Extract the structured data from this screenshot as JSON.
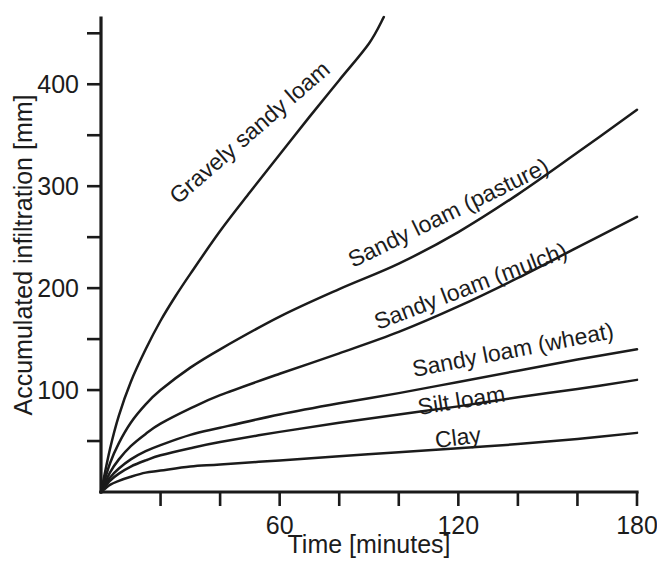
{
  "chart_data": {
    "type": "line",
    "title": "",
    "xlabel": "Time [minutes]",
    "ylabel": "Accumulated infiltration [mm]",
    "xlim": [
      0,
      180
    ],
    "ylim": [
      0,
      465
    ],
    "grid": false,
    "legend_position": "inline-curve-labels",
    "x_ticks_major": [
      60,
      120,
      180
    ],
    "x_ticks_major_labels": [
      "60",
      "120",
      "180"
    ],
    "x_ticks_minor": [
      20,
      40,
      80,
      100,
      140,
      160
    ],
    "y_ticks_major": [
      100,
      200,
      300,
      400
    ],
    "y_ticks_major_labels": [
      "100",
      "200",
      "300",
      "400"
    ],
    "y_ticks_minor": [
      50,
      150,
      250,
      350,
      450
    ],
    "x": [
      0,
      5,
      10,
      15,
      20,
      30,
      40,
      50,
      60,
      80,
      100,
      120,
      140,
      160,
      180
    ],
    "series": [
      {
        "name": "Gravely sandy loam",
        "label": "Gravely sandy loam",
        "x": [
          0,
          3,
          6,
          10,
          15,
          20,
          25,
          30,
          40,
          50,
          60,
          70,
          80,
          90,
          95
        ],
        "values": [
          0,
          42,
          75,
          108,
          140,
          168,
          192,
          214,
          256,
          294,
          331,
          368,
          404,
          440,
          466
        ]
      },
      {
        "name": "Sandy loam (pasture)",
        "label": "Sandy loam (pasture)",
        "x": [
          0,
          3,
          6,
          10,
          15,
          20,
          30,
          40,
          60,
          80,
          100,
          120,
          140,
          160,
          180
        ],
        "values": [
          0,
          28,
          48,
          68,
          86,
          100,
          122,
          140,
          172,
          199,
          224,
          255,
          292,
          333,
          375
        ]
      },
      {
        "name": "Sandy loam (mulch)",
        "label": "Sandy loam (mulch)",
        "x": [
          0,
          3,
          6,
          10,
          15,
          20,
          30,
          40,
          60,
          80,
          100,
          120,
          140,
          160,
          180
        ],
        "values": [
          0,
          19,
          32,
          45,
          57,
          67,
          82,
          95,
          116,
          136,
          157,
          182,
          210,
          240,
          270
        ]
      },
      {
        "name": "Sandy loam (wheat)",
        "label": "Sandy loam (wheat)",
        "x": [
          0,
          3,
          6,
          10,
          15,
          20,
          30,
          40,
          60,
          80,
          100,
          120,
          140,
          160,
          180
        ],
        "values": [
          0,
          14,
          23,
          32,
          40,
          46,
          56,
          63,
          76,
          87,
          97,
          108,
          119,
          130,
          140
        ]
      },
      {
        "name": "Silt loam",
        "label": "Silt loam",
        "x": [
          0,
          3,
          6,
          10,
          15,
          20,
          30,
          40,
          60,
          80,
          100,
          120,
          140,
          160,
          180
        ],
        "values": [
          0,
          11,
          18,
          25,
          31,
          36,
          43,
          49,
          59,
          68,
          76,
          84,
          93,
          101,
          110
        ]
      },
      {
        "name": "Clay",
        "label": "Clay",
        "x": [
          0,
          3,
          6,
          10,
          15,
          20,
          30,
          40,
          60,
          80,
          100,
          120,
          140,
          160,
          180
        ],
        "values": [
          0,
          7,
          11,
          15,
          19,
          21,
          25,
          27,
          31,
          35,
          39,
          43,
          47,
          52,
          58
        ]
      }
    ],
    "series_label_placements": [
      {
        "name": "Gravely sandy loam",
        "x": 178,
        "y": 205,
        "rotate": -41
      },
      {
        "name": "Sandy loam (pasture)",
        "x": 353,
        "y": 268,
        "rotate": -26
      },
      {
        "name": "Sandy loam (mulch)",
        "x": 378,
        "y": 330,
        "rotate": -21
      },
      {
        "name": "Sandy loam (wheat)",
        "x": 414,
        "y": 377,
        "rotate": -11
      },
      {
        "name": "Silt loam",
        "x": 419,
        "y": 415,
        "rotate": -9
      },
      {
        "name": "Clay",
        "x": 436,
        "y": 448,
        "rotate": -7
      }
    ],
    "colors": {
      "line": "#1b1b1b",
      "axis": "#1a1a1a",
      "text": "#1c1c1c",
      "background": "#ffffff"
    }
  }
}
